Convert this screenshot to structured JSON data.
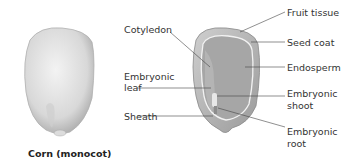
{
  "diagram": {
    "caption": "Corn (monocot)",
    "labels_left": {
      "cotyledon": "Cotyledon",
      "embryonic_leaf_line1": "Embryonic",
      "embryonic_leaf_line2": "leaf",
      "sheath": "Sheath"
    },
    "labels_right": {
      "fruit_tissue": "Fruit tissue",
      "seed_coat": "Seed coat",
      "endosperm": "Endosperm",
      "embryonic_shoot_line1": "Embryonic",
      "embryonic_shoot_line2": "shoot",
      "embryonic_root_line1": "Embryonic",
      "embryonic_root_line2": "root"
    },
    "colors": {
      "kernel_light": "#e6e6e6",
      "kernel_shade": "#b9b9b9",
      "endosperm": "#a9a9a9",
      "seed_coat_line": "#f2f2f2",
      "leader_line": "#444444"
    }
  }
}
